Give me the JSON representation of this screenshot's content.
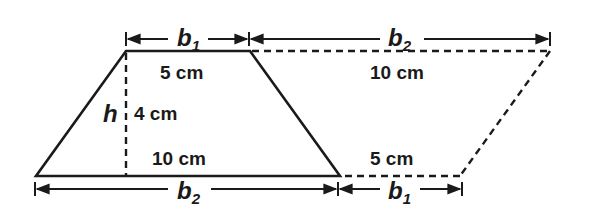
{
  "diagram": {
    "title": "",
    "trapezoid": {
      "top_base_label": "5 cm",
      "bottom_base_label": "10 cm",
      "height_label": "4 cm",
      "height_var": "h"
    },
    "extension": {
      "top_label": "10 cm",
      "bottom_label": "5 cm"
    },
    "dimensions": {
      "top_left": {
        "var": "b",
        "sub": "1"
      },
      "top_right": {
        "var": "b",
        "sub": "2"
      },
      "bottom_left": {
        "var": "b",
        "sub": "2"
      },
      "bottom_right": {
        "var": "b",
        "sub": "1"
      }
    },
    "colors": {
      "stroke": "#1a1a1a",
      "background": "#ffffff"
    }
  }
}
